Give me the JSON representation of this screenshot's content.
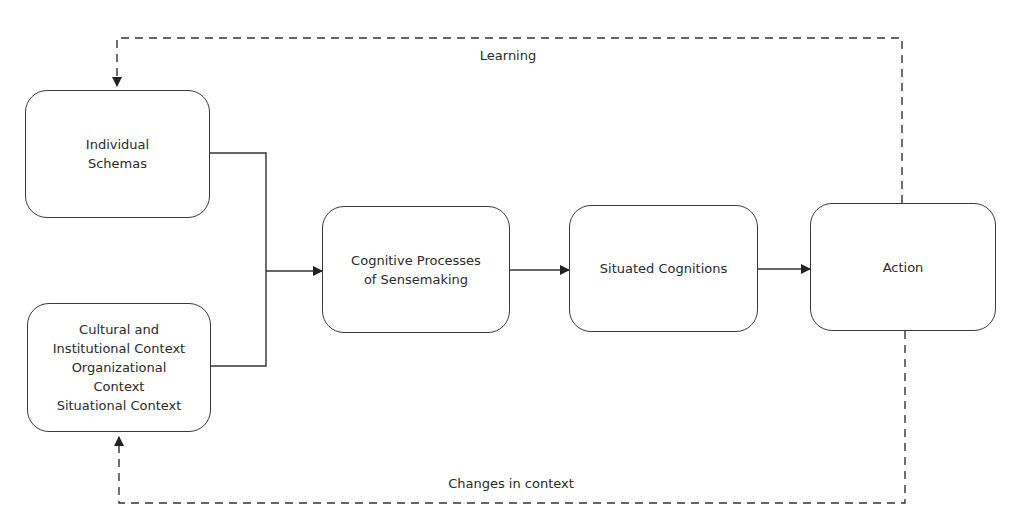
{
  "diagram": {
    "type": "flowchart",
    "nodes": [
      {
        "id": "individual_schemas",
        "label": "Individual\nSchemas"
      },
      {
        "id": "context",
        "label": "Cultural and\nInstitutional Context\nOrganizational\nContext\nSituational Context"
      },
      {
        "id": "cognitive_processes",
        "label": "Cognitive Processes\nof Sensemaking"
      },
      {
        "id": "situated_cognitions",
        "label": "Situated Cognitions"
      },
      {
        "id": "action",
        "label": "Action"
      }
    ],
    "edges": [
      {
        "from": "individual_schemas",
        "to": "cognitive_processes",
        "style": "solid"
      },
      {
        "from": "context",
        "to": "cognitive_processes",
        "style": "solid"
      },
      {
        "from": "cognitive_processes",
        "to": "situated_cognitions",
        "style": "solid"
      },
      {
        "from": "situated_cognitions",
        "to": "action",
        "style": "solid"
      },
      {
        "from": "action",
        "to": "individual_schemas",
        "style": "dashed",
        "label": "Learning"
      },
      {
        "from": "action",
        "to": "context",
        "style": "dashed",
        "label": "Changes in context"
      }
    ],
    "labels": {
      "learning": "Learning",
      "changes_in_context": "Changes in context"
    },
    "colors": {
      "line": "#2a2a2a",
      "background": "#ffffff"
    }
  }
}
